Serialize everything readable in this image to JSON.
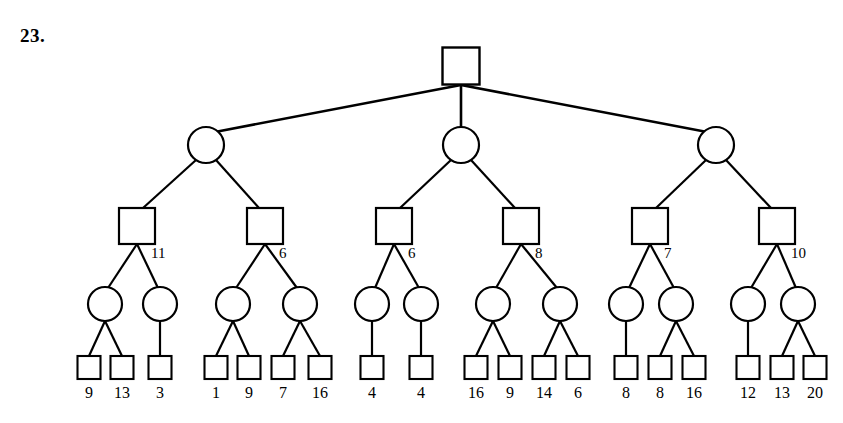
{
  "problem": {
    "number": "23."
  },
  "diagram": {
    "type": "minimax-game-tree",
    "node_shapes": {
      "level_0": "square",
      "level_1": "circle",
      "level_2": "square",
      "level_3": "circle",
      "level_4": "square"
    },
    "root": {
      "label": "",
      "shape": "square",
      "x": 461,
      "y": 66,
      "size": 37
    },
    "level1_nodes": [
      {
        "id": "c0",
        "label": "",
        "shape": "circle",
        "x": 206,
        "y": 145,
        "r": 18
      },
      {
        "id": "c1",
        "label": "",
        "shape": "circle",
        "x": 461,
        "y": 145,
        "r": 18
      },
      {
        "id": "c2",
        "label": "",
        "shape": "circle",
        "x": 716,
        "y": 145,
        "r": 18
      }
    ],
    "level2_nodes": [
      {
        "id": "s0",
        "label": "11",
        "shape": "square",
        "x": 137,
        "y": 226,
        "size": 36,
        "parent": "c0"
      },
      {
        "id": "s1",
        "label": "6",
        "shape": "square",
        "x": 265,
        "y": 226,
        "size": 36,
        "parent": "c0"
      },
      {
        "id": "s2",
        "label": "6",
        "shape": "square",
        "x": 394,
        "y": 226,
        "size": 36,
        "parent": "c1"
      },
      {
        "id": "s3",
        "label": "8",
        "shape": "square",
        "x": 521,
        "y": 226,
        "size": 36,
        "parent": "c1"
      },
      {
        "id": "s4",
        "label": "7",
        "shape": "square",
        "x": 650,
        "y": 226,
        "size": 36,
        "parent": "c2"
      },
      {
        "id": "s5",
        "label": "10",
        "shape": "square",
        "x": 777,
        "y": 226,
        "size": 36,
        "parent": "c2"
      }
    ],
    "level3_nodes": [
      {
        "id": "m0",
        "shape": "circle",
        "x": 105,
        "y": 304,
        "r": 17,
        "parent": "s0"
      },
      {
        "id": "m1",
        "shape": "circle",
        "x": 160,
        "y": 304,
        "r": 17,
        "parent": "s0"
      },
      {
        "id": "m2",
        "shape": "circle",
        "x": 233,
        "y": 304,
        "r": 17,
        "parent": "s1"
      },
      {
        "id": "m3",
        "shape": "circle",
        "x": 300,
        "y": 304,
        "r": 17,
        "parent": "s1"
      },
      {
        "id": "m4",
        "shape": "circle",
        "x": 372,
        "y": 304,
        "r": 17,
        "parent": "s2"
      },
      {
        "id": "m5",
        "shape": "circle",
        "x": 421,
        "y": 304,
        "r": 17,
        "parent": "s2"
      },
      {
        "id": "m6",
        "shape": "circle",
        "x": 493,
        "y": 304,
        "r": 17,
        "parent": "s3"
      },
      {
        "id": "m7",
        "shape": "circle",
        "x": 560,
        "y": 304,
        "r": 17,
        "parent": "s3"
      },
      {
        "id": "m8",
        "shape": "circle",
        "x": 626,
        "y": 304,
        "r": 17,
        "parent": "s4"
      },
      {
        "id": "m9",
        "shape": "circle",
        "x": 676,
        "y": 304,
        "r": 17,
        "parent": "s4"
      },
      {
        "id": "m10",
        "shape": "circle",
        "x": 748,
        "y": 304,
        "r": 17,
        "parent": "s5"
      },
      {
        "id": "m11",
        "shape": "circle",
        "x": 798,
        "y": 304,
        "r": 17,
        "parent": "s5"
      }
    ],
    "leaves": [
      {
        "value": "9",
        "x": 89,
        "y": 367,
        "size": 23,
        "parent": "m0"
      },
      {
        "value": "13",
        "x": 122,
        "y": 367,
        "size": 23,
        "parent": "m0"
      },
      {
        "value": "3",
        "x": 160,
        "y": 367,
        "size": 23,
        "parent": "m1"
      },
      {
        "value": "1",
        "x": 216,
        "y": 367,
        "size": 23,
        "parent": "m2"
      },
      {
        "value": "249",
        "x": 0,
        "y": 0,
        "size": 0,
        "parent": ""
      },
      {
        "value": "9",
        "x": 249,
        "y": 367,
        "size": 23,
        "parent": "m2"
      },
      {
        "value": "7",
        "x": 283,
        "y": 367,
        "size": 23,
        "parent": "m3"
      },
      {
        "value": "16",
        "x": 320,
        "y": 367,
        "size": 23,
        "parent": "m3"
      },
      {
        "value": "4",
        "x": 372,
        "y": 367,
        "size": 23,
        "parent": "m4"
      },
      {
        "value": "4",
        "x": 421,
        "y": 367,
        "size": 23,
        "parent": "m5"
      },
      {
        "value": "16",
        "x": 476,
        "y": 367,
        "size": 23,
        "parent": "m6"
      },
      {
        "value": "9",
        "x": 510,
        "y": 367,
        "size": 23,
        "parent": "m6"
      },
      {
        "value": "14",
        "x": 544,
        "y": 367,
        "size": 23,
        "parent": "m7"
      },
      {
        "value": "6",
        "x": 578,
        "y": 367,
        "size": 23,
        "parent": "m7"
      },
      {
        "value": "8",
        "x": 626,
        "y": 367,
        "size": 23,
        "parent": "m8"
      },
      {
        "value": "8",
        "x": 660,
        "y": 367,
        "size": 23,
        "parent": "m9"
      },
      {
        "value": "16",
        "x": 694,
        "y": 367,
        "size": 23,
        "parent": "m9"
      },
      {
        "value": "12",
        "x": 748,
        "y": 367,
        "size": 23,
        "parent": "m10"
      },
      {
        "value": "13",
        "x": 782,
        "y": 367,
        "size": 23,
        "parent": "m11"
      },
      {
        "value": "20",
        "x": 815,
        "y": 367,
        "size": 23,
        "parent": "m11"
      }
    ],
    "leaf_values": [
      "9",
      "13",
      "3",
      "1",
      "9",
      "7",
      "16",
      "4",
      "4",
      "16",
      "9",
      "14",
      "6",
      "8",
      "8",
      "16",
      "12",
      "13",
      "20"
    ],
    "internal_labels": [
      "11",
      "6",
      "6",
      "8",
      "7",
      "10"
    ],
    "colors": {
      "stroke": "#000000",
      "fill": "#ffffff",
      "background": "#ffffff"
    }
  }
}
